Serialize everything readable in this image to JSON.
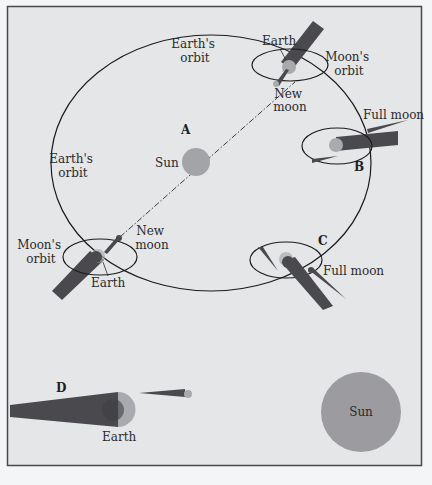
{
  "colors": {
    "background": "#e4e6e8",
    "frame": "#4a4a4e",
    "orbit_line": "#1c1c1e",
    "shadow": "#4a4a4e",
    "planet": "#a9aaae",
    "sun_small": "#a3a4a8",
    "sun_large": "#9c9ca0",
    "text": "#2a2a2c"
  },
  "labels": {
    "earths_orbit_top": [
      "Earth's",
      "orbit"
    ],
    "earths_orbit_left": [
      "Earth's",
      "orbit"
    ],
    "sun_center": "Sun",
    "marker_a": "A",
    "marker_b": "B",
    "marker_c": "C",
    "marker_d": "D",
    "top_earth": "Earth",
    "top_moons_orbit": [
      "Moon's",
      "orbit"
    ],
    "top_new_moon": [
      "New",
      "moon"
    ],
    "b_full_moon": "Full moon",
    "left_moons_orbit": [
      "Moon's",
      "orbit"
    ],
    "left_new_moon": [
      "New",
      "moon"
    ],
    "left_earth": "Earth",
    "c_full_moon": "Full moon",
    "d_earth": "Earth",
    "sun_large": "Sun"
  }
}
